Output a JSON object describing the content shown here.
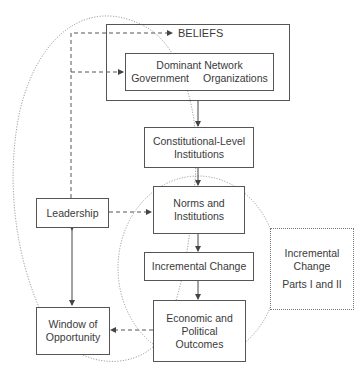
{
  "diagram": {
    "beliefs": {
      "label": "BELIEFS"
    },
    "dominant_network": {
      "line1": "Dominant Network",
      "line2_left": "Government",
      "line2_right": "Organizations"
    },
    "constitutional": {
      "line1": "Constitutional-Level",
      "line2": "Institutions"
    },
    "norms": {
      "line1": "Norms and",
      "line2": "Institutions"
    },
    "incremental": {
      "label": "Incremental Change"
    },
    "outcomes": {
      "line1": "Economic and",
      "line2": "Political",
      "line3": "Outcomes"
    },
    "leadership": {
      "label": "Leadership"
    },
    "window": {
      "line1": "Window of",
      "line2": "Opportunity"
    },
    "side_note": {
      "line1": "Incremental",
      "line2": "Change",
      "line3": "Parts I and II"
    }
  },
  "colors": {
    "line": "#555555",
    "dotted": "#888888",
    "text": "#3a3a3a"
  }
}
